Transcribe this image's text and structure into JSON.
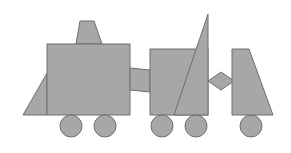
{
  "diagram": {
    "fill_color": "#a7a7a7",
    "stroke_color": "#6f6f6f",
    "background": "#ffffff",
    "shapes": [
      {
        "id": "front-triangle",
        "type": "polygon",
        "points": "23,115 47,115 47,73"
      },
      {
        "id": "chimney",
        "type": "polygon",
        "points": "80,21 94,21 102,44 76,44"
      },
      {
        "id": "engine-body",
        "type": "rect",
        "x": 47,
        "y": 44,
        "w": 83,
        "h": 71
      },
      {
        "id": "connector",
        "type": "polygon",
        "points": "130,68 150,70 150,92 130,90"
      },
      {
        "id": "car-body",
        "type": "rect",
        "x": 150,
        "y": 49,
        "w": 58,
        "h": 66
      },
      {
        "id": "tall-triangle",
        "type": "polygon",
        "points": "208,14 208,115 174,115"
      },
      {
        "id": "diamond",
        "type": "polygon",
        "points": "208,81 221,72 234,81 221,90"
      },
      {
        "id": "trailer",
        "type": "polygon",
        "points": "232,49 249,49 273,115 232,115"
      }
    ],
    "wheels": [
      {
        "id": "wheel-1",
        "cx": 71,
        "cy": 126,
        "r": 11
      },
      {
        "id": "wheel-2",
        "cx": 105,
        "cy": 126,
        "r": 11
      },
      {
        "id": "wheel-3",
        "cx": 162,
        "cy": 126,
        "r": 11
      },
      {
        "id": "wheel-4",
        "cx": 196,
        "cy": 126,
        "r": 11
      },
      {
        "id": "wheel-5",
        "cx": 251,
        "cy": 126,
        "r": 11
      }
    ]
  }
}
